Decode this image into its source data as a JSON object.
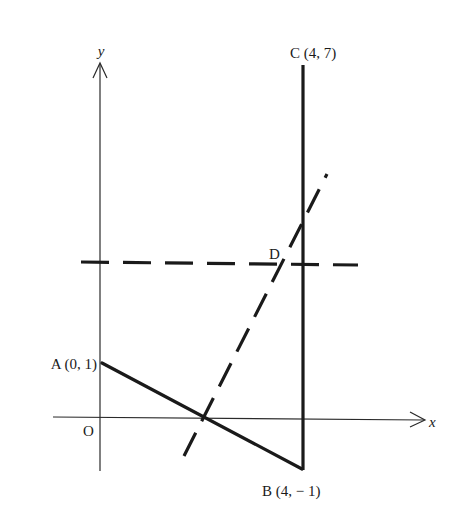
{
  "figure": {
    "axes": {
      "x_label": "x",
      "y_label": "y",
      "origin_label": "O"
    },
    "points": {
      "A": {
        "label": "A (0, 1)",
        "x": 0,
        "y": 1
      },
      "B": {
        "label": "B (4, − 1)",
        "x": 4,
        "y": -1
      },
      "C": {
        "label": "C (4, 7)",
        "x": 4,
        "y": 7
      },
      "D": {
        "label": "D"
      }
    },
    "segments": [
      {
        "name": "AB",
        "from": "A",
        "to": "B",
        "style": "solid"
      },
      {
        "name": "BC",
        "from": "B",
        "to": "C",
        "style": "solid"
      }
    ],
    "dashed_lines": [
      {
        "name": "horizontal-through-D",
        "orientation": "horizontal"
      },
      {
        "name": "perpendicular-bisector-of-AB",
        "orientation": "oblique"
      }
    ],
    "colors": {
      "ink": "#1a1a1a",
      "background": "#ffffff"
    }
  }
}
